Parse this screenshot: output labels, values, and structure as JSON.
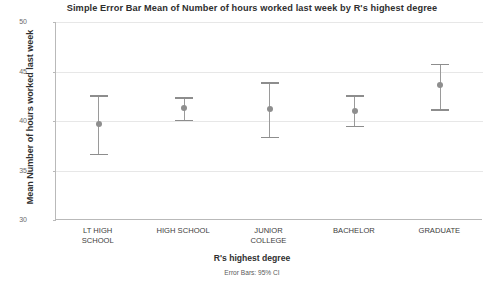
{
  "chart_data": {
    "type": "scatter",
    "title": "Simple Error Bar Mean of Number of hours worked last week by R's highest degree",
    "xlabel": "R's highest degree",
    "ylabel": "Mean Number of hours worked last week",
    "footnote": "Error Bars: 95% CI",
    "grid": true,
    "legend": "none",
    "ylim": [
      30,
      50
    ],
    "yticks": [
      30,
      35,
      40,
      45,
      50
    ],
    "ytick_labels": [
      "30",
      "35",
      "40",
      "45",
      "50"
    ],
    "categories": [
      "LT HIGH\nSCHOOL",
      "HIGH SCHOOL",
      "JUNIOR\nCOLLEGE",
      "BACHELOR",
      "GRADUATE"
    ],
    "series": [
      {
        "name": "Mean hours worked last week",
        "values": [
          39.7,
          41.3,
          41.2,
          41.0,
          43.6
        ],
        "ci_low": [
          36.7,
          40.1,
          38.4,
          39.5,
          41.2
        ],
        "ci_high": [
          42.6,
          42.4,
          43.9,
          42.6,
          45.8
        ]
      }
    ],
    "points": [
      {
        "category": "LT HIGH SCHOOL",
        "mean": 39.7,
        "ci_low": 36.7,
        "ci_high": 42.6
      },
      {
        "category": "HIGH SCHOOL",
        "mean": 41.3,
        "ci_low": 40.1,
        "ci_high": 42.4
      },
      {
        "category": "JUNIOR COLLEGE",
        "mean": 41.2,
        "ci_low": 38.4,
        "ci_high": 43.9
      },
      {
        "category": "BACHELOR",
        "mean": 41.0,
        "ci_low": 39.5,
        "ci_high": 42.6
      },
      {
        "category": "GRADUATE",
        "mean": 43.6,
        "ci_low": 41.2,
        "ci_high": 45.8
      }
    ],
    "colors": {
      "marker": "#8e8e8e",
      "errorbar": "#9a9a9a",
      "gridline": "#e7e7e7",
      "axis": "#b9b9b9",
      "text": "#2f2f2f",
      "background": "#ffffff"
    }
  }
}
